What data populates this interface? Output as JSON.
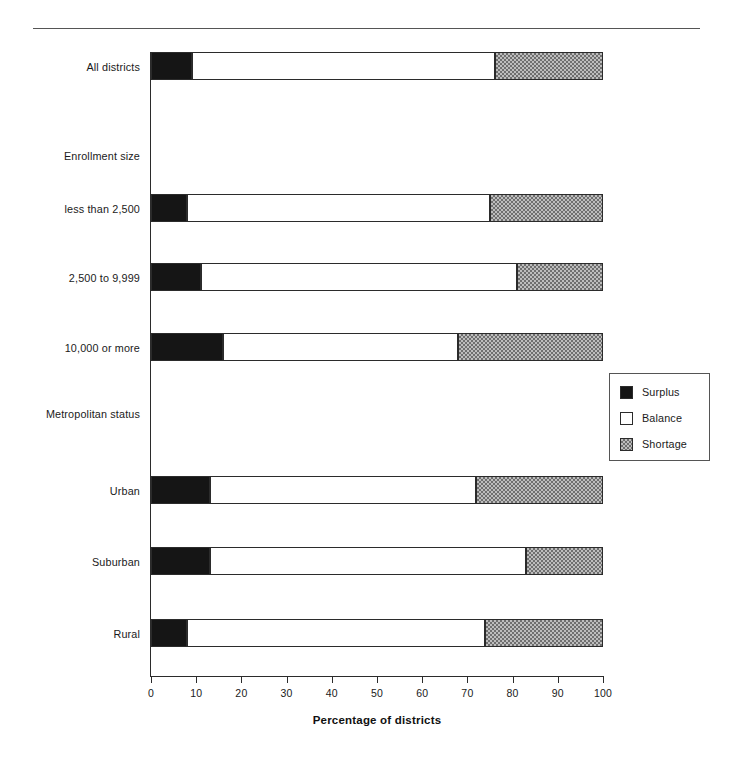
{
  "chart_data": {
    "type": "bar",
    "orientation": "horizontal",
    "stacked": true,
    "title": "",
    "xlabel": "Percentage of districts",
    "ylabel": "",
    "xlim": [
      0,
      100
    ],
    "xticks": [
      0,
      10,
      20,
      30,
      40,
      50,
      60,
      70,
      80,
      90,
      100
    ],
    "xtick_labels": [
      "0",
      "10",
      "20",
      "30",
      "40",
      "50",
      "60",
      "70",
      "80",
      "90",
      "100"
    ],
    "grid": false,
    "legend_position": "right-middle",
    "legend": [
      "Surplus",
      "Balance",
      "Shortage"
    ],
    "categories": [
      "All districts",
      "less than 2,500",
      "2,500 to 9,999",
      "10,000 or more",
      "Urban",
      "Suburban",
      "Rural"
    ],
    "group_headings": [
      "Enrollment size",
      "Metropolitan status"
    ],
    "series": [
      {
        "name": "Surplus",
        "values": [
          9,
          8,
          11,
          16,
          13,
          13,
          8
        ]
      },
      {
        "name": "Balance",
        "values": [
          67,
          67,
          70,
          52,
          59,
          70,
          66
        ]
      },
      {
        "name": "Shortage",
        "values": [
          24,
          25,
          19,
          32,
          28,
          17,
          26
        ]
      }
    ],
    "cumulative_boundaries": {
      "surplus_end": [
        9,
        8,
        11,
        16,
        13,
        13,
        8
      ],
      "balance_end": [
        76,
        75,
        81,
        68,
        72,
        83,
        74
      ],
      "shortage_end": [
        100,
        100,
        100,
        100,
        100,
        100,
        100
      ]
    }
  },
  "axis": {
    "x_title": "Percentage of districts"
  },
  "rows": [
    {
      "label": "All districts",
      "kind": "bar",
      "top": 52,
      "surplus": 9,
      "balance_end": 76
    },
    {
      "label": "Enrollment size",
      "kind": "group",
      "top": 150
    },
    {
      "label": "less than 2,500",
      "kind": "bar",
      "top": 194,
      "surplus": 8,
      "balance_end": 75
    },
    {
      "label": "2,500 to 9,999",
      "kind": "bar",
      "top": 263,
      "surplus": 11,
      "balance_end": 81
    },
    {
      "label": "10,000 or more",
      "kind": "bar",
      "top": 333,
      "surplus": 16,
      "balance_end": 68
    },
    {
      "label": "Metropolitan status",
      "kind": "group",
      "top": 408
    },
    {
      "label": "Urban",
      "kind": "bar",
      "top": 476,
      "surplus": 13,
      "balance_end": 72
    },
    {
      "label": "Suburban",
      "kind": "bar",
      "top": 547,
      "surplus": 13,
      "balance_end": 83
    },
    {
      "label": "Rural",
      "kind": "bar",
      "top": 619,
      "surplus": 8,
      "balance_end": 74
    }
  ],
  "legend": {
    "items": [
      {
        "label": "Surplus",
        "swatch": "solid-black-swatch"
      },
      {
        "label": "Balance",
        "swatch": "white-swatch"
      },
      {
        "label": "Shortage",
        "swatch": "checkered-gray-swatch"
      }
    ]
  },
  "colors": {
    "surplus": "#151515",
    "balance": "#ffffff",
    "shortage": "#bdbdbd",
    "outline": "#2b2b2b",
    "text": "#1a1a1a"
  }
}
